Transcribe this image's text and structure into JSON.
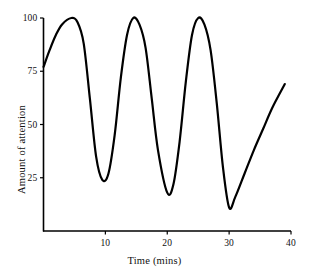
{
  "chart_data": {
    "type": "line",
    "title": "",
    "subtitle": "",
    "xlabel": "Time (mins)",
    "ylabel": "Amount of attention",
    "xlim": [
      0,
      40
    ],
    "ylim": [
      0,
      100
    ],
    "xticks": [
      10,
      20,
      30,
      40
    ],
    "yticks": [
      25,
      50,
      75,
      100
    ],
    "xtick_labels": [
      "10",
      "20",
      "30",
      "40"
    ],
    "ytick_labels": [
      "25",
      "50",
      "75",
      "100"
    ],
    "grid": false,
    "legend": "none",
    "line_color": "#000000",
    "line_width": 2.2,
    "axis_color": "#000000",
    "background_color": "#ffffff",
    "annotations": [],
    "series": [
      {
        "name": "Amount of attention",
        "x": [
          0,
          1,
          2,
          3,
          4.5,
          5.5,
          6.5,
          7.5,
          8.5,
          9.5,
          10.5,
          11.5,
          12.5,
          13.5,
          14.5,
          15.5,
          16.5,
          17.5,
          18.5,
          20,
          21,
          22,
          23,
          24,
          25,
          26,
          27,
          28,
          29,
          30,
          31,
          32.5,
          34,
          35.5,
          37,
          39
        ],
        "y": [
          77,
          85,
          92,
          97,
          100,
          98,
          88,
          62,
          35,
          24,
          27,
          45,
          72,
          92,
          100,
          97,
          86,
          62,
          38,
          18,
          22,
          42,
          70,
          92,
          100,
          97,
          85,
          60,
          30,
          11,
          16,
          27,
          38,
          48,
          58,
          69
        ]
      }
    ],
    "key_points": {
      "start": {
        "x": 0,
        "y": 77
      },
      "peaks": [
        {
          "x": 4.5,
          "y": 100
        },
        {
          "x": 14.5,
          "y": 100
        },
        {
          "x": 25,
          "y": 100
        }
      ],
      "troughs": [
        {
          "x": 9.5,
          "y": 24
        },
        {
          "x": 20,
          "y": 18
        },
        {
          "x": 30,
          "y": 11
        }
      ],
      "end": {
        "x": 39,
        "y": 69
      }
    }
  }
}
